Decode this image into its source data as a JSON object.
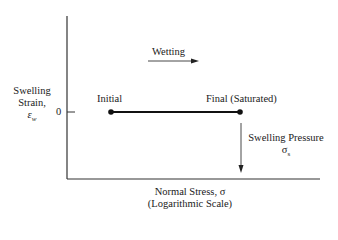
{
  "diagram": {
    "y_axis_label": [
      "Swelling",
      "Strain,",
      "ε_w"
    ],
    "y_axis_label_line1": "Swelling",
    "y_axis_label_line2": "Strain,",
    "y_axis_symbol": "ε",
    "y_axis_symbol_sub": "w",
    "y_tick_label": "0",
    "x_axis_label_line1": "Normal Stress, σ",
    "x_axis_label_line2": "(Logarithmic Scale)",
    "wetting_label": "Wetting",
    "initial_label": "Initial",
    "final_label": "Final (Saturated)",
    "swelling_pressure_label": "Swelling Pressure",
    "swelling_pressure_symbol": "σ",
    "swelling_pressure_sub": "s",
    "colors": {
      "line": "#1a1a1a",
      "background": "#ffffff"
    }
  }
}
